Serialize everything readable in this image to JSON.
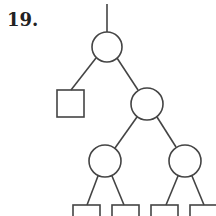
{
  "problem": {
    "number": "19."
  },
  "diagram": {
    "type": "tree",
    "stroke": "#444444",
    "background": "#ffffff",
    "nodes": [
      {
        "id": "root",
        "shape": "circle",
        "cx": 107,
        "cy": 47,
        "r": 15
      },
      {
        "id": "leaf-left",
        "shape": "square",
        "x": 57,
        "y": 90,
        "size": 27
      },
      {
        "id": "mid-right",
        "shape": "circle",
        "cx": 147,
        "cy": 104,
        "r": 16
      },
      {
        "id": "gc-left",
        "shape": "circle",
        "cx": 105,
        "cy": 161,
        "r": 16
      },
      {
        "id": "gc-right",
        "shape": "circle",
        "cx": 185,
        "cy": 161,
        "r": 16
      },
      {
        "id": "leaf-1",
        "shape": "square",
        "x": 73,
        "y": 205,
        "size": 27
      },
      {
        "id": "leaf-2",
        "shape": "square",
        "x": 112,
        "y": 205,
        "size": 27
      },
      {
        "id": "leaf-3",
        "shape": "square",
        "x": 151,
        "y": 205,
        "size": 27
      },
      {
        "id": "leaf-4",
        "shape": "square",
        "x": 190,
        "y": 205,
        "size": 27
      }
    ]
  }
}
